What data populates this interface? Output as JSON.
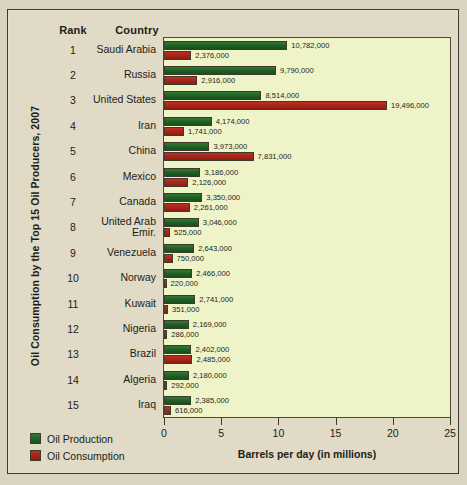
{
  "table": {
    "rank_header": "Rank",
    "country_header": "Country"
  },
  "legend": {
    "production_label": "Oil Production",
    "consumption_label": "Oil Consumption",
    "production_color": "#1f5e25",
    "consumption_color": "#a5231a"
  },
  "colors": {
    "panel_background": "#e0dac6",
    "plot_background": "#eef3c8",
    "outer_background": "#d9d3c0",
    "text": "#1d1d18"
  },
  "chart_data": {
    "type": "bar",
    "title": "Oil Consumption by the Top 15 Oil Producers, 2007",
    "xlabel": "Barrels per day (in millions)",
    "ylabel": "",
    "orientation": "horizontal",
    "grid": false,
    "legend_position": "bottom-left",
    "xlim": [
      0,
      25
    ],
    "xticks": [
      0,
      5,
      10,
      15,
      20,
      25
    ],
    "xtick_labels": [
      "0",
      "5",
      "10",
      "15",
      "20",
      "25"
    ],
    "units": "million barrels per day",
    "categories": [
      "Saudi Arabia",
      "Russia",
      "United States",
      "Iran",
      "China",
      "Mexico",
      "Canada",
      "United Arab Emir.",
      "Venezuela",
      "Norway",
      "Kuwait",
      "Nigeria",
      "Brazil",
      "Algeria",
      "Iraq"
    ],
    "ranks": [
      1,
      2,
      3,
      4,
      5,
      6,
      7,
      8,
      9,
      10,
      11,
      12,
      13,
      14,
      15
    ],
    "series": [
      {
        "name": "Oil Production",
        "color": "#1f5e25",
        "values": [
          10.782,
          9.79,
          8.514,
          4.174,
          3.973,
          3.186,
          3.35,
          3.046,
          2.643,
          2.466,
          2.741,
          2.169,
          2.402,
          2.18,
          2.385
        ],
        "labels": [
          "10,782,000",
          "9,790,000",
          "8,514,000",
          "4,174,000",
          "3,973,000",
          "3,186,000",
          "3,350,000",
          "3,046,000",
          "2,643,000",
          "2,466,000",
          "2,741,000",
          "2,169,000",
          "2,402,000",
          "2,180,000",
          "2,385,000"
        ]
      },
      {
        "name": "Oil Consumption",
        "color": "#a5231a",
        "values": [
          2.376,
          2.916,
          19.496,
          1.741,
          7.831,
          2.126,
          2.261,
          0.525,
          0.75,
          0.22,
          0.351,
          0.286,
          2.485,
          0.292,
          0.616
        ],
        "labels": [
          "2,376,000",
          "2,916,000",
          "19,496,000",
          "1,741,000",
          "7,831,000",
          "2,126,000",
          "2,261,000",
          "525,000",
          "750,000",
          "220,000",
          "351,000",
          "286,000",
          "2,485,000",
          "292,000",
          "616,000"
        ]
      }
    ],
    "rows": [
      {
        "rank": "1",
        "country": "Saudi Arabia",
        "country_line1": "Saudi Arabia",
        "country_line2": "",
        "production": 10.782,
        "consumption": 2.376,
        "production_label": "10,782,000",
        "consumption_label": "2,376,000"
      },
      {
        "rank": "2",
        "country": "Russia",
        "country_line1": "Russia",
        "country_line2": "",
        "production": 9.79,
        "consumption": 2.916,
        "production_label": "9,790,000",
        "consumption_label": "2,916,000"
      },
      {
        "rank": "3",
        "country": "United States",
        "country_line1": "United States",
        "country_line2": "",
        "production": 8.514,
        "consumption": 19.496,
        "production_label": "8,514,000",
        "consumption_label": "19,496,000"
      },
      {
        "rank": "4",
        "country": "Iran",
        "country_line1": "Iran",
        "country_line2": "",
        "production": 4.174,
        "consumption": 1.741,
        "production_label": "4,174,000",
        "consumption_label": "1,741,000"
      },
      {
        "rank": "5",
        "country": "China",
        "country_line1": "China",
        "country_line2": "",
        "production": 3.973,
        "consumption": 7.831,
        "production_label": "3,973,000",
        "consumption_label": "7,831,000"
      },
      {
        "rank": "6",
        "country": "Mexico",
        "country_line1": "Mexico",
        "country_line2": "",
        "production": 3.186,
        "consumption": 2.126,
        "production_label": "3,186,000",
        "consumption_label": "2,126,000"
      },
      {
        "rank": "7",
        "country": "Canada",
        "country_line1": "Canada",
        "country_line2": "",
        "production": 3.35,
        "consumption": 2.261,
        "production_label": "3,350,000",
        "consumption_label": "2,261,000"
      },
      {
        "rank": "8",
        "country": "United Arab Emir.",
        "country_line1": "United Arab",
        "country_line2": "Emir.",
        "production": 3.046,
        "consumption": 0.525,
        "production_label": "3,046,000",
        "consumption_label": "525,000"
      },
      {
        "rank": "9",
        "country": "Venezuela",
        "country_line1": "Venezuela",
        "country_line2": "",
        "production": 2.643,
        "consumption": 0.75,
        "production_label": "2,643,000",
        "consumption_label": "750,000"
      },
      {
        "rank": "10",
        "country": "Norway",
        "country_line1": "Norway",
        "country_line2": "",
        "production": 2.466,
        "consumption": 0.22,
        "production_label": "2,466,000",
        "consumption_label": "220,000"
      },
      {
        "rank": "11",
        "country": "Kuwait",
        "country_line1": "Kuwait",
        "country_line2": "",
        "production": 2.741,
        "consumption": 0.351,
        "production_label": "2,741,000",
        "consumption_label": "351,000"
      },
      {
        "rank": "12",
        "country": "Nigeria",
        "country_line1": "Nigeria",
        "country_line2": "",
        "production": 2.169,
        "consumption": 0.286,
        "production_label": "2,169,000",
        "consumption_label": "286,000"
      },
      {
        "rank": "13",
        "country": "Brazil",
        "country_line1": "Brazil",
        "country_line2": "",
        "production": 2.402,
        "consumption": 2.485,
        "production_label": "2,402,000",
        "consumption_label": "2,485,000"
      },
      {
        "rank": "14",
        "country": "Algeria",
        "country_line1": "Algeria",
        "country_line2": "",
        "production": 2.18,
        "consumption": 0.292,
        "production_label": "2,180,000",
        "consumption_label": "292,000"
      },
      {
        "rank": "15",
        "country": "Iraq",
        "country_line1": "Iraq",
        "country_line2": "",
        "production": 2.385,
        "consumption": 0.616,
        "production_label": "2,385,000",
        "consumption_label": "616,000"
      }
    ]
  }
}
